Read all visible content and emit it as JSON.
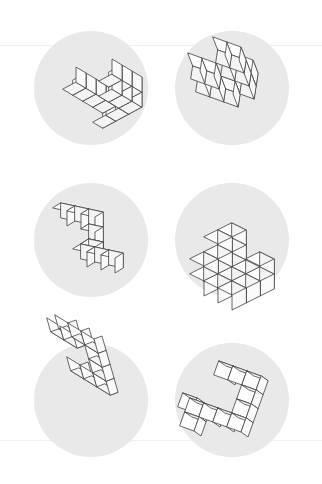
{
  "sheet": {
    "title": "Polycube Rotation Figures",
    "width": 322,
    "height": 484,
    "background_color": "#ffffff",
    "disc_color": "#e9e9e9",
    "cube_stroke_color": "#4a4a4a",
    "cube_fill_color": "#fdfdfd",
    "rules": [
      {
        "name": "faint-rule-top",
        "y": 45
      },
      {
        "name": "faint-rule-bottom",
        "y": 440
      }
    ],
    "grid": {
      "columns": 2,
      "rows": 3
    }
  },
  "panels": [
    {
      "id": "panel-1",
      "label": "figure-top-left",
      "cx": 91,
      "cy": 88,
      "r": 57,
      "projection": {
        "ax": 13,
        "ay": -7,
        "bx": 0,
        "by": -15,
        "cx": 10,
        "cy": 6
      },
      "origin": {
        "x": -18,
        "y": 22
      },
      "cubes": [
        [
          0,
          0,
          2
        ],
        [
          1,
          0,
          2
        ],
        [
          2,
          0,
          2
        ],
        [
          0,
          1,
          2
        ],
        [
          1,
          1,
          2
        ],
        [
          2,
          1,
          2
        ],
        [
          2,
          0,
          1
        ],
        [
          2,
          1,
          1
        ],
        [
          2,
          0,
          0
        ],
        [
          2,
          1,
          0
        ],
        [
          0,
          1,
          1
        ],
        [
          0,
          1,
          0
        ],
        [
          0,
          1,
          -1
        ]
      ]
    },
    {
      "id": "panel-2",
      "label": "figure-top-right",
      "cx": 232,
      "cy": 88,
      "r": 57,
      "projection": {
        "ax": 14,
        "ay": 5,
        "bx": -5,
        "by": -13,
        "cx": 2,
        "cy": -13
      },
      "origin": {
        "x": -36,
        "y": 4
      },
      "cubes": [
        [
          0,
          0,
          0
        ],
        [
          1,
          0,
          0
        ],
        [
          2,
          0,
          0
        ],
        [
          0,
          1,
          0
        ],
        [
          1,
          1,
          0
        ],
        [
          2,
          0,
          1
        ],
        [
          2,
          1,
          1
        ],
        [
          2,
          2,
          1
        ],
        [
          3,
          0,
          1
        ],
        [
          3,
          1,
          1
        ],
        [
          3,
          2,
          1
        ],
        [
          2,
          0,
          2
        ],
        [
          3,
          0,
          2
        ]
      ]
    },
    {
      "id": "panel-3",
      "label": "figure-middle-left",
      "cx": 91,
      "cy": 240,
      "r": 57,
      "projection": {
        "ax": 14,
        "ay": 3,
        "bx": -8,
        "by": 5,
        "cx": 0,
        "cy": -15
      },
      "origin": {
        "x": -30,
        "y": -22
      },
      "cubes": [
        [
          0,
          0,
          0
        ],
        [
          1,
          0,
          0
        ],
        [
          2,
          0,
          0
        ],
        [
          2,
          0,
          -1
        ],
        [
          2,
          0,
          -2
        ],
        [
          2,
          1,
          -2
        ],
        [
          3,
          1,
          -2
        ],
        [
          4,
          1,
          -2
        ],
        [
          2,
          0,
          -2
        ]
      ]
    },
    {
      "id": "panel-4",
      "label": "figure-middle-right",
      "cx": 232,
      "cy": 240,
      "r": 57,
      "projection": {
        "ax": 14,
        "ay": 7,
        "bx": -14,
        "by": 7,
        "cx": 0,
        "cy": -15
      },
      "origin": {
        "x": 0,
        "y": 28
      },
      "cubes": [
        [
          0,
          0,
          0
        ],
        [
          1,
          0,
          0
        ],
        [
          2,
          0,
          0
        ],
        [
          0,
          1,
          0
        ],
        [
          1,
          1,
          0
        ],
        [
          2,
          1,
          0
        ],
        [
          0,
          2,
          0
        ],
        [
          1,
          2,
          0
        ],
        [
          2,
          2,
          0
        ],
        [
          0,
          0,
          1
        ],
        [
          0,
          1,
          1
        ],
        [
          0,
          2,
          1
        ],
        [
          0,
          0,
          2
        ],
        [
          0,
          1,
          2
        ],
        [
          2,
          0,
          1
        ]
      ]
    },
    {
      "id": "panel-5",
      "label": "figure-bottom-left",
      "cx": 91,
      "cy": 400,
      "r": 57,
      "projection": {
        "ax": 13,
        "ay": 8,
        "bx": -4,
        "by": -14,
        "cx": -8,
        "cy": 3
      },
      "origin": {
        "x": -12,
        "y": -32
      },
      "cubes": [
        [
          0,
          0,
          0
        ],
        [
          1,
          0,
          0
        ],
        [
          2,
          0,
          0
        ],
        [
          2,
          1,
          0
        ],
        [
          2,
          2,
          0
        ],
        [
          2,
          3,
          0
        ],
        [
          0,
          3,
          0
        ],
        [
          1,
          3,
          0
        ],
        [
          0,
          3,
          1
        ],
        [
          1,
          3,
          1
        ]
      ]
    },
    {
      "id": "panel-6",
      "label": "figure-bottom-right",
      "cx": 232,
      "cy": 400,
      "r": 57,
      "projection": {
        "ax": 14,
        "ay": 5,
        "bx": -5,
        "by": 14,
        "cx": -7,
        "cy": -5
      },
      "origin": {
        "x": -6,
        "y": -34
      },
      "cubes": [
        [
          0,
          0,
          0
        ],
        [
          1,
          0,
          0
        ],
        [
          2,
          0,
          0
        ],
        [
          2,
          1,
          0
        ],
        [
          2,
          2,
          0
        ],
        [
          2,
          3,
          0
        ],
        [
          0,
          3,
          0
        ],
        [
          1,
          3,
          0
        ],
        [
          -1,
          3,
          0
        ],
        [
          -1,
          4,
          0
        ],
        [
          -1,
          3,
          1
        ]
      ]
    }
  ]
}
